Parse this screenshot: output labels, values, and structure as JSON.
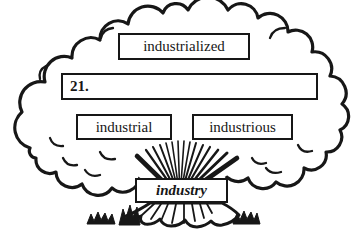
{
  "illustration": {
    "boxes": {
      "top": "industrialized",
      "blank_label": "21.",
      "middle_left": "industrial",
      "middle_right": "industrious",
      "trunk": "industry"
    },
    "colors": {
      "ink": "#171717",
      "paper": "#ffffff"
    }
  }
}
